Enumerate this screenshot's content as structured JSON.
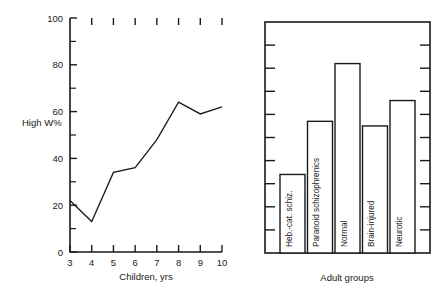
{
  "chart_data": [
    {
      "type": "line",
      "panel": "left",
      "title": "",
      "xlabel": "Children, yrs",
      "ylabel": "High W%",
      "x": [
        3,
        4,
        5,
        6,
        7,
        8,
        9,
        10
      ],
      "values": [
        22,
        13,
        34,
        36,
        48,
        64,
        59,
        62
      ],
      "xlim": [
        3,
        10
      ],
      "ylim": [
        0,
        100
      ],
      "xticks": [
        3,
        4,
        5,
        6,
        7,
        8,
        9,
        10
      ],
      "xticklabels": [
        "3",
        "4",
        "5",
        "6",
        "7",
        "8",
        "9",
        "10"
      ],
      "yticks": [
        0,
        20,
        40,
        60,
        80,
        100
      ],
      "yticklabels": [
        "0",
        "20",
        "40",
        "60",
        "80",
        "100"
      ],
      "yminorticks": [
        10,
        30,
        50,
        70,
        90
      ],
      "grid": false,
      "legend": "none",
      "line_color": "#1a1a1a"
    },
    {
      "type": "bar",
      "panel": "right",
      "title": "",
      "xlabel": "Adult groups",
      "ylabel": "",
      "categories": [
        "Heb.-cat. schiz.",
        "Paranoid schizophrenics",
        "Normal",
        "Brain-injured",
        "Neurotic"
      ],
      "values": [
        34,
        57,
        82,
        55,
        66
      ],
      "ylim": [
        0,
        100
      ],
      "yticks": [
        0,
        10,
        20,
        30,
        40,
        50,
        60,
        70,
        80,
        90,
        100
      ],
      "yticklabels": [],
      "ytick_side": "both",
      "grid": false,
      "legend": "none",
      "bar_fill": "#ffffff",
      "bar_edge": "#1a1a1a"
    }
  ],
  "left_panel": {
    "y_axis_label": "High W%",
    "x_axis_label": "Children, yrs",
    "y_ticklabels": [
      "100",
      "80",
      "60",
      "40",
      "20",
      "0"
    ],
    "x_ticklabels": [
      "3",
      "4",
      "5",
      "6",
      "7",
      "8",
      "9",
      "10"
    ]
  },
  "right_panel": {
    "x_axis_label": "Adult groups",
    "bars": [
      {
        "label": "Heb.-cat. schiz.",
        "value": 34
      },
      {
        "label": "Paranoid schizophrenics",
        "value": 57
      },
      {
        "label": "Normal",
        "value": 82
      },
      {
        "label": "Brain-injured",
        "value": 55
      },
      {
        "label": "Neurotic",
        "value": 66
      }
    ]
  }
}
